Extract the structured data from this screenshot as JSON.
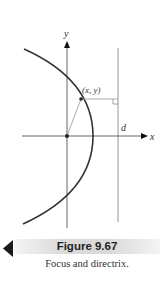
{
  "figure": {
    "labels": {
      "y_axis": "y",
      "x_axis": "x",
      "directrix": "d",
      "point": "(x, y)"
    },
    "colors": {
      "curve": "#333333",
      "axis": "#444444",
      "line": "#888888",
      "caption_bar": "#d9d9d9"
    }
  },
  "caption": {
    "title": "Figure 9.67",
    "text": "Focus and directrix."
  },
  "navigation": {
    "prev_icon": "triangle-left-icon"
  }
}
